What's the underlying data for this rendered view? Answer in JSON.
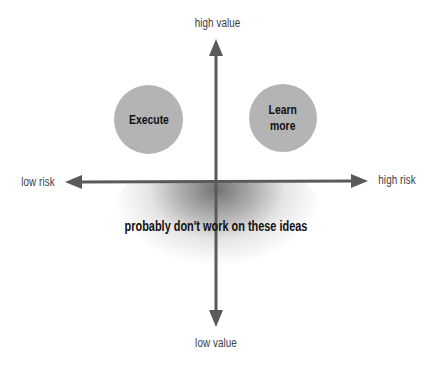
{
  "diagram": {
    "type": "2x2 risk/value quadrant",
    "axes": {
      "vertical": {
        "top_label": "high value",
        "bottom_label": "low value"
      },
      "horizontal": {
        "left_label": "low risk",
        "right_label": "high risk"
      }
    },
    "quadrants": [
      {
        "id": "execute",
        "label": "Execute",
        "position": "top-left"
      },
      {
        "id": "learn-more",
        "label": "Learn\nmore",
        "position": "top-right"
      }
    ],
    "zone": {
      "label": "probably don't work on these ideas",
      "position": "below horizontal axis (low value)"
    },
    "colors": {
      "axis": "#5a5a5a",
      "circle_fill": "#b4b4b4",
      "label_text": "#3c3c3c",
      "bold_text": "#111111",
      "background": "#ffffff"
    }
  }
}
